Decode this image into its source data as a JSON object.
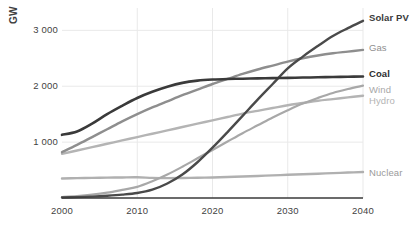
{
  "chart_data": {
    "type": "line",
    "title": "",
    "xlabel": "",
    "ylabel": "GW",
    "xlim": [
      2000,
      2040
    ],
    "ylim": [
      0,
      3400
    ],
    "grid": true,
    "legend_position": "right-of-plot-end-labels",
    "x_ticks": [
      "2000",
      "2010",
      "2020",
      "2030",
      "2040"
    ],
    "x_tick_values": [
      2000,
      2010,
      2020,
      2030,
      2040
    ],
    "y_ticks": [
      "1 000",
      "2 000",
      "3 000"
    ],
    "y_tick_values": [
      1000,
      2000,
      3000
    ],
    "x": [
      2000,
      2002,
      2004,
      2006,
      2008,
      2010,
      2012,
      2014,
      2016,
      2018,
      2020,
      2022,
      2024,
      2026,
      2028,
      2030,
      2032,
      2034,
      2036,
      2038,
      2040
    ],
    "series": [
      {
        "name": "Solar PV",
        "label": "Solar PV",
        "color": "#4a4a4a",
        "width": 2.4,
        "bold_label": true,
        "label_color": "#3a3a3a",
        "values": [
          10,
          15,
          25,
          40,
          60,
          90,
          150,
          260,
          420,
          640,
          900,
          1180,
          1470,
          1760,
          2040,
          2320,
          2530,
          2720,
          2900,
          3040,
          3170
        ]
      },
      {
        "name": "Gas",
        "label": "Gas",
        "color": "#8e8e8e",
        "width": 2.4,
        "bold_label": false,
        "label_color": "#8e8e8e",
        "values": [
          820,
          950,
          1090,
          1230,
          1370,
          1500,
          1620,
          1730,
          1840,
          1940,
          2040,
          2130,
          2220,
          2300,
          2370,
          2440,
          2500,
          2550,
          2590,
          2620,
          2650
        ]
      },
      {
        "name": "Coal",
        "label": "Coal",
        "color": "#3a3a3a",
        "width": 2.6,
        "bold_label": true,
        "label_color": "#2e2e2e",
        "values": [
          1130,
          1190,
          1330,
          1500,
          1650,
          1790,
          1900,
          1990,
          2060,
          2100,
          2120,
          2130,
          2135,
          2140,
          2145,
          2150,
          2155,
          2160,
          2165,
          2170,
          2175
        ]
      },
      {
        "name": "Wind",
        "label": "Wind",
        "color": "#a8a8a8",
        "width": 2.2,
        "bold_label": false,
        "label_color": "#a8a8a8",
        "values": [
          18,
          35,
          60,
          95,
          145,
          200,
          300,
          420,
          560,
          710,
          860,
          1010,
          1160,
          1300,
          1440,
          1570,
          1690,
          1790,
          1880,
          1950,
          2010
        ]
      },
      {
        "name": "Hydro",
        "label": "Hydro",
        "color": "#b4b4b4",
        "width": 2.4,
        "bold_label": false,
        "label_color": "#b4b4b4",
        "values": [
          790,
          850,
          910,
          970,
          1030,
          1090,
          1150,
          1210,
          1270,
          1330,
          1390,
          1450,
          1510,
          1560,
          1610,
          1660,
          1700,
          1740,
          1770,
          1800,
          1830
        ]
      },
      {
        "name": "Nuclear",
        "label": "Nuclear",
        "color": "#b0b0b0",
        "width": 2.4,
        "bold_label": false,
        "label_color": "#9a9a9a",
        "values": [
          350,
          355,
          360,
          365,
          368,
          370,
          360,
          355,
          358,
          362,
          368,
          375,
          385,
          395,
          405,
          415,
          425,
          435,
          445,
          455,
          465
        ]
      }
    ]
  },
  "axes": {
    "y_axis_title": "GW"
  },
  "colors": {
    "grid": "#e9e9e9",
    "axis": "#3a3a3a",
    "background": "#ffffff"
  }
}
